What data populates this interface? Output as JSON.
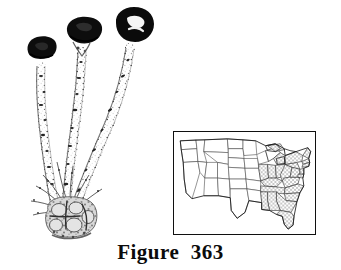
{
  "plate": {
    "caption": "Figure  363",
    "background_color": "#ffffff",
    "ink_color": "#101010",
    "width": 341,
    "height": 270
  },
  "specimen": {
    "label": "fungal-specimen-illustration",
    "description": "Three club-shaped fruiting bodies arising from a common basal cluster",
    "stalk_count": 3,
    "cap_color": "#0d0d0d",
    "stalk_color": "#3a3a3a",
    "base_color": "#6b6b6b",
    "parts": [
      {
        "name": "cap-left",
        "shade": "dark"
      },
      {
        "name": "cap-center",
        "shade": "dark"
      },
      {
        "name": "cap-right",
        "shade": "dark"
      },
      {
        "name": "stalk-left",
        "shade": "light-speckled"
      },
      {
        "name": "stalk-center",
        "shade": "light-speckled"
      },
      {
        "name": "stalk-right",
        "shade": "light-speckled"
      },
      {
        "name": "basal-cluster",
        "shade": "mottled-grey"
      }
    ]
  },
  "map": {
    "label": "united-states-distribution-map",
    "region": "Contiguous United States",
    "border_color": "#101010",
    "state_line_color": "#444444",
    "shaded_fill": "#b9b9b9",
    "unshaded_fill": "#ffffff",
    "shading_style": "stipple",
    "shaded_region": "Eastern United States",
    "shaded_states": [
      "Michigan",
      "Ohio",
      "Indiana",
      "Illinois",
      "Kentucky",
      "Tennessee",
      "West Virginia",
      "Virginia",
      "North Carolina",
      "South Carolina",
      "Georgia",
      "Alabama",
      "Pennsylvania",
      "New York",
      "New Jersey",
      "Maryland",
      "Delaware",
      "Connecticut",
      "Massachusetts",
      "Vermont",
      "New Hampshire",
      "Maine",
      "Florida"
    ]
  }
}
